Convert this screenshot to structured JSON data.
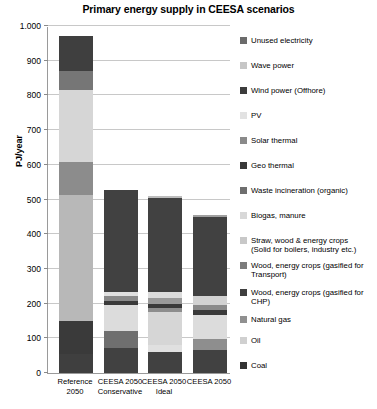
{
  "chart_data": {
    "type": "bar",
    "stacked": true,
    "title": "Primary energy supply in CEESA scenarios",
    "xlabel": "",
    "ylabel": "PJ/year",
    "ylim": [
      0,
      1000
    ],
    "ytick_labels": [
      "0",
      "100",
      "200",
      "300",
      "400",
      "500",
      "600",
      "700",
      "800",
      "900",
      "1.000"
    ],
    "ytick_values": [
      0,
      100,
      200,
      300,
      400,
      500,
      600,
      700,
      800,
      900,
      1000
    ],
    "grid": true,
    "legend_position": "right",
    "categories": [
      "Reference\n2050",
      "CEESA 2050\nConservative",
      "CEESA 2050\nIdeal",
      "CEESA 2050"
    ],
    "category_lines": [
      [
        "Reference",
        "2050"
      ],
      [
        "CEESA 2050",
        "Conservative"
      ],
      [
        "CEESA 2050",
        "Ideal"
      ],
      [
        "CEESA 2050",
        ""
      ]
    ],
    "totals": [
      970,
      527,
      511,
      455
    ],
    "series": [
      {
        "name": "Coal",
        "color": "#3f3f3f",
        "values": [
          55,
          0,
          0,
          0
        ]
      },
      {
        "name": "Oil",
        "color": "#414141",
        "values": [
          95,
          72,
          60,
          66
        ]
      },
      {
        "name": "Natural gas",
        "color": "#b5b5b5",
        "values": [
          362,
          0,
          0,
          0
        ]
      },
      {
        "name": "Wood, energy crops (gasified for CHP)",
        "color": "#6f6f6f",
        "values": [
          0,
          48,
          0,
          32
        ]
      },
      {
        "name": "Wood, energy crops (gasified for Transport)",
        "color": "#8d8d8d",
        "values": [
          0,
          0,
          5,
          0
        ]
      },
      {
        "name": "Straw, wood & energy crops (Solid for boilers, industry etc.)",
        "color": "#dcdcdc",
        "values": [
          0,
          77,
          96,
          69
        ]
      },
      {
        "name": "Biogas, manure",
        "color": "#cfcfcf",
        "values": [
          0,
          0,
          20,
          0
        ]
      },
      {
        "name": "Waste incineration (organic)",
        "color": "#9a9a9a",
        "values": [
          0,
          0,
          17,
          24
        ]
      },
      {
        "name": "Geo thermal",
        "color": "#3a3a3a",
        "values": [
          0,
          11,
          12,
          14
        ]
      },
      {
        "name": "Solar thermal",
        "color": "#8a8a8a",
        "values": [
          0,
          13,
          17,
          16
        ]
      },
      {
        "name": "PV",
        "color": "#e4e4e4",
        "values": [
          0,
          14,
          0,
          0
        ]
      },
      {
        "name": "Wind power (Offhore)",
        "color": "#414141",
        "values": [
          0,
          292,
          284,
          229
        ]
      },
      {
        "name": "Wave power",
        "color": "#cccccc",
        "values": [
          0,
          0,
          0,
          5
        ]
      },
      {
        "name": "Unused electricity",
        "color": "#6b6b6b",
        "values": [
          0,
          0,
          0,
          0
        ]
      },
      {
        "name": "Reference-light-top",
        "color": "#d3d3d3",
        "values": [
          207,
          0,
          0,
          0
        ]
      },
      {
        "name": "Reference-mid-gray",
        "color": "#8c8c8c",
        "values": [
          97,
          0,
          0,
          0
        ]
      },
      {
        "name": "Reference-pale",
        "color": "#dcdcdc",
        "values": [
          96,
          0,
          0,
          0
        ]
      },
      {
        "name": "Reference-dark-gray",
        "color": "#6e6e6e",
        "values": [
          0,
          0,
          0,
          0
        ]
      }
    ],
    "bars": [
      {
        "category": "Reference 2050",
        "total": 970,
        "segments": [
          {
            "label": "Coal",
            "value": 55,
            "color": "#3f3f3f"
          },
          {
            "label": "Oil",
            "value": 95,
            "color": "#3a3a3a"
          },
          {
            "label": "Natural gas",
            "value": 362,
            "color": "#b8b8b8"
          },
          {
            "label": "Straw, wood & energy crops (Solid for boilers, industry etc.)",
            "value": 97,
            "color": "#8c8c8c"
          },
          {
            "label": "Biogas, manure",
            "value": 207,
            "color": "#d6d6d6"
          },
          {
            "label": "Waste incineration (organic)",
            "value": 55,
            "color": "#767676"
          },
          {
            "label": "Unused electricity",
            "value": 99,
            "color": "#3f3f3f"
          }
        ]
      },
      {
        "category": "CEESA 2050 Conservative",
        "total": 527,
        "segments": [
          {
            "label": "Oil",
            "value": 72,
            "color": "#414141"
          },
          {
            "label": "Wood, energy crops (gasified for CHP)",
            "value": 48,
            "color": "#6f6f6f"
          },
          {
            "label": "Straw, wood & energy crops (Solid for boilers, industry etc.)",
            "value": 77,
            "color": "#dcdcdc"
          },
          {
            "label": "Geo thermal",
            "value": 11,
            "color": "#3a3a3a"
          },
          {
            "label": "Solar thermal",
            "value": 13,
            "color": "#8a8a8a"
          },
          {
            "label": "PV",
            "value": 14,
            "color": "#e0e0e0"
          },
          {
            "label": "Wind power (Offhore)",
            "value": 292,
            "color": "#414141"
          }
        ]
      },
      {
        "category": "CEESA 2050 Ideal",
        "total": 511,
        "segments": [
          {
            "label": "Oil",
            "value": 60,
            "color": "#414141"
          },
          {
            "label": "Biogas, manure",
            "value": 20,
            "color": "#e0e0e0"
          },
          {
            "label": "Straw, wood & energy crops (Solid for boilers, industry etc.)",
            "value": 96,
            "color": "#d6d6d6"
          },
          {
            "label": "Wood, energy crops (gasified for CHP)",
            "value": 12,
            "color": "#8d8d8d"
          },
          {
            "label": "Geo thermal",
            "value": 12,
            "color": "#3a3a3a"
          },
          {
            "label": "Waste incineration (organic)",
            "value": 17,
            "color": "#9a9a9a"
          },
          {
            "label": "Solar thermal",
            "value": 17,
            "color": "#dcdcdc"
          },
          {
            "label": "Wind power (Offhore)",
            "value": 271,
            "color": "#414141"
          },
          {
            "label": "Wave power",
            "value": 6,
            "color": "#bdbdbd"
          }
        ]
      },
      {
        "category": "CEESA 2050",
        "total": 455,
        "segments": [
          {
            "label": "Oil",
            "value": 66,
            "color": "#414141"
          },
          {
            "label": "Wood, energy crops (gasified for CHP)",
            "value": 32,
            "color": "#8e8e8e"
          },
          {
            "label": "Straw, wood & energy crops (Solid for boilers, industry etc.)",
            "value": 69,
            "color": "#dcdcdc"
          },
          {
            "label": "Geo thermal",
            "value": 14,
            "color": "#3a3a3a"
          },
          {
            "label": "Solar thermal",
            "value": 16,
            "color": "#8a8a8a"
          },
          {
            "label": "Waste incineration (organic)",
            "value": 24,
            "color": "#d2d2d2"
          },
          {
            "label": "Wind power (Offhore)",
            "value": 229,
            "color": "#414141"
          },
          {
            "label": "Wave power",
            "value": 5,
            "color": "#a0a0a0"
          }
        ]
      }
    ],
    "legend": [
      {
        "label": "Unused electricity",
        "color": "#6b6b6b"
      },
      {
        "label": "Wave power",
        "color": "#c6c6c6"
      },
      {
        "label": "Wind power (Offhore)",
        "color": "#3c3c3c"
      },
      {
        "label": "PV",
        "color": "#e2e2e2"
      },
      {
        "label": "Solar thermal",
        "color": "#8a8a8a"
      },
      {
        "label": "Geo thermal",
        "color": "#383838"
      },
      {
        "label": "Waste incineration (organic)",
        "color": "#6e6e6e"
      },
      {
        "label": "Biogas, manure",
        "color": "#d8d8d8"
      },
      {
        "label": "Straw, wood & energy crops\n(Solid for boilers, industry etc.)",
        "color": "#c8c8c8"
      },
      {
        "label": "Wood, energy crops (gasified for\nTransport)",
        "color": "#7c7c7c"
      },
      {
        "label": "Wood, energy crops (gasified for\nCHP)",
        "color": "#3f3f3f"
      },
      {
        "label": "Natural gas",
        "color": "#909090"
      },
      {
        "label": "Oil",
        "color": "#d0d0d0"
      },
      {
        "label": "Coal",
        "color": "#333333"
      }
    ]
  }
}
